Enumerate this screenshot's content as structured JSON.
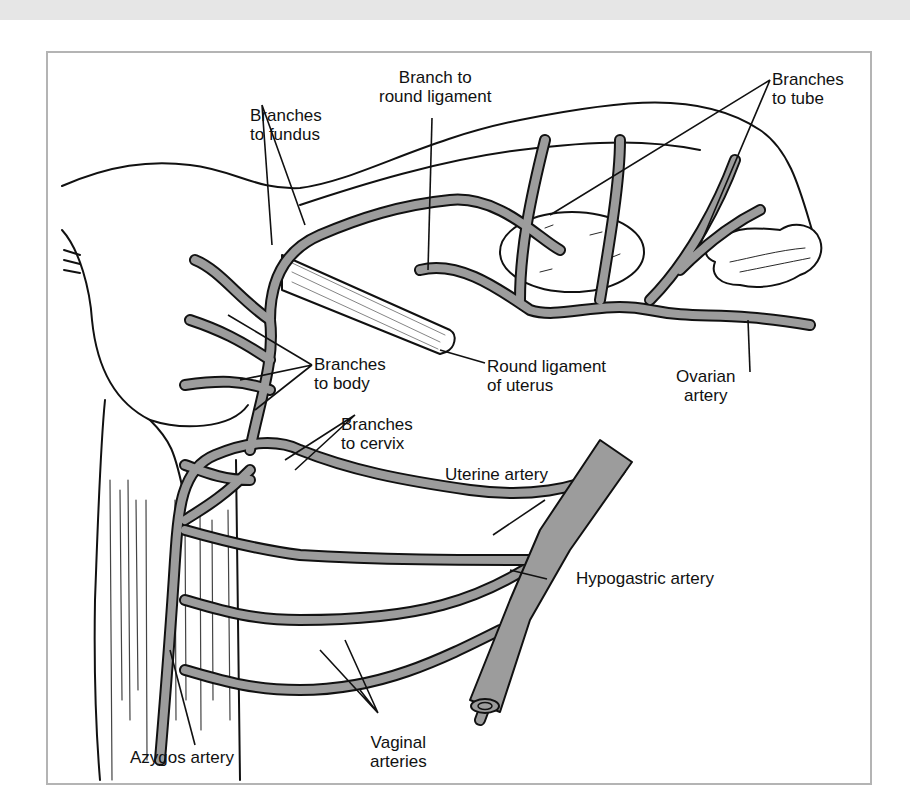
{
  "figure": {
    "colors": {
      "artery_fill": "#9c9c9c",
      "outline": "#111111",
      "frame_border": "#b4b4b4",
      "top_band": "#e6e6e6",
      "background": "#ffffff"
    },
    "labels": {
      "branch_round_ligament": {
        "line1": "Branch to",
        "line2": "round ligament"
      },
      "branches_fundus": {
        "line1": "Branches",
        "line2": "to fundus"
      },
      "branches_tube": {
        "line1": "Branches",
        "line2": "to tube"
      },
      "branches_body": {
        "line1": "Branches",
        "line2": "to body"
      },
      "round_ligament_uterus": {
        "line1": "Round ligament",
        "line2": "of uterus"
      },
      "ovarian_artery": {
        "line1": "Ovarian",
        "line2": "artery"
      },
      "branches_cervix": {
        "line1": "Branches",
        "line2": "to cervix"
      },
      "uterine_artery": {
        "line1": "Uterine artery"
      },
      "hypogastric_artery": {
        "line1": "Hypogastric artery"
      },
      "azygos_artery": {
        "line1": "Azygos artery"
      },
      "vaginal_arteries": {
        "line1": "Vaginal",
        "line2": "arteries"
      }
    }
  }
}
